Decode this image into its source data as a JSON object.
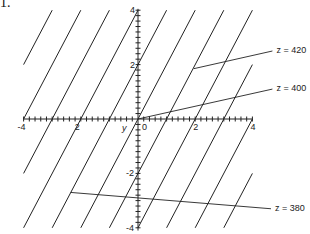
{
  "header": {
    "label": "1."
  },
  "axes": {
    "x_ticks": [
      {
        "value": -4,
        "label": "-4"
      },
      {
        "value": -2,
        "label": "2"
      },
      {
        "value": 0,
        "label": "0"
      },
      {
        "value": 2,
        "label": "2"
      },
      {
        "value": 4,
        "label": "4"
      }
    ],
    "y_ticks": [
      {
        "value": 4,
        "label": "4"
      },
      {
        "value": 2,
        "label": "2"
      },
      {
        "value": -2,
        "label": "-2"
      },
      {
        "value": -4,
        "label": "-4"
      }
    ],
    "axis_label": "y",
    "xlim": [
      -4,
      4
    ],
    "ylim": [
      -4,
      4
    ]
  },
  "family": {
    "description": "parallel lines y = 2x + c",
    "slope": 2,
    "intercepts": [
      10,
      8,
      6,
      4,
      2,
      0,
      -2,
      -4,
      -6,
      -8,
      -10
    ]
  },
  "callouts": [
    {
      "label": "z = 420",
      "from": [
        1.95,
        1.85
      ],
      "to": [
        4.7,
        2.5
      ]
    },
    {
      "label": "z = 400",
      "from": [
        0,
        0
      ],
      "to": [
        4.7,
        1.1
      ]
    },
    {
      "label": "z = 380",
      "from": [
        -2.35,
        -2.7
      ],
      "to": [
        4.65,
        -3.3
      ]
    }
  ],
  "colors": {
    "ink": "#222222",
    "background": "#ffffff"
  }
}
